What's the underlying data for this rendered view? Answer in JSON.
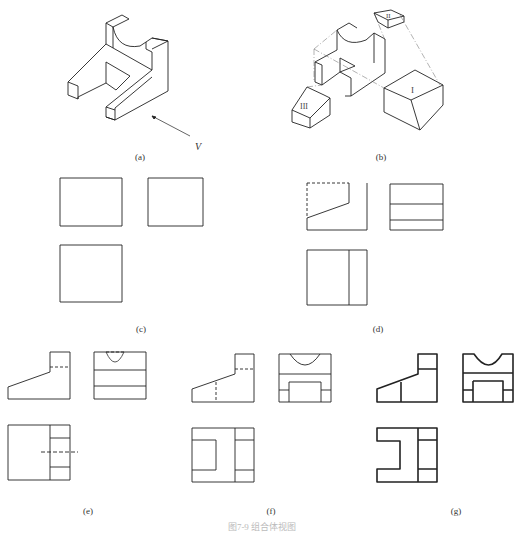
{
  "figure": {
    "caption": "图7-9 组合体视图",
    "panels": [
      {
        "id": "a",
        "label": "(a)",
        "description": "isometric view of bearing support with viewing direction arrow",
        "arrow_label": "V"
      },
      {
        "id": "b",
        "label": "(b)",
        "description": "exploded decomposition into parts",
        "parts": [
          "I",
          "II",
          "III"
        ]
      },
      {
        "id": "c",
        "label": "(c)",
        "description": "three-view layout of bounding boxes"
      },
      {
        "id": "d",
        "label": "(d)",
        "description": "three views with part I"
      },
      {
        "id": "e",
        "label": "(e)",
        "description": "adding parts II and III"
      },
      {
        "id": "f",
        "label": "(f)",
        "description": "adding slot"
      },
      {
        "id": "g",
        "label": "(g)",
        "description": "final thickened three views"
      }
    ]
  }
}
